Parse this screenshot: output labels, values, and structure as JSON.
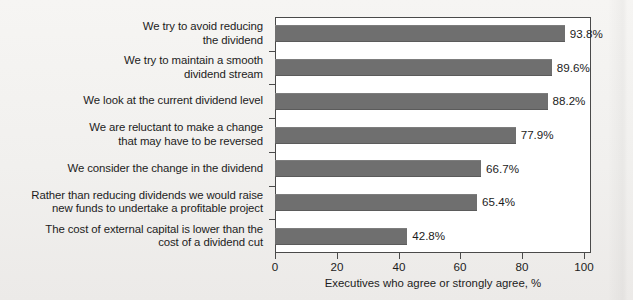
{
  "chart_data": {
    "type": "bar",
    "orientation": "horizontal",
    "title": "",
    "xlabel": "Executives who agree or strongly agree, %",
    "ylabel": "",
    "xlim": [
      0,
      100
    ],
    "xticks": [
      "0",
      "20",
      "40",
      "60",
      "80",
      "100"
    ],
    "grid": false,
    "legend": null,
    "bar_color": "#6f6f6f",
    "plot_background": "#ffffff",
    "page_background": "#f3f2f0",
    "categories": [
      "We try to avoid reducing the dividend",
      "We try to maintain a smooth dividend stream",
      "We look at the current dividend level",
      "We are reluctant to make a change that may have to be reversed",
      "We consider the change in the dividend",
      "Rather than reducing dividends we would raise new funds to undertake a profitable project",
      "The cost of external capital is lower than the cost of a dividend cut"
    ],
    "category_lines": [
      [
        "We try to avoid reducing",
        "the dividend"
      ],
      [
        "We try to maintain a smooth",
        "dividend stream"
      ],
      [
        "We look at the current dividend level"
      ],
      [
        "We are reluctant to make a change",
        "that may have to be reversed"
      ],
      [
        "We consider the change in the dividend"
      ],
      [
        "Rather than reducing dividends we would raise",
        "new funds to undertake a profitable project"
      ],
      [
        "The cost of external capital is lower than the",
        "cost of a dividend cut"
      ]
    ],
    "values": [
      93.8,
      89.6,
      88.2,
      77.9,
      66.7,
      65.4,
      42.8
    ],
    "value_labels": [
      "93.8%",
      "89.6%",
      "88.2%",
      "77.9%",
      "66.7%",
      "65.4%",
      "42.8%"
    ]
  }
}
